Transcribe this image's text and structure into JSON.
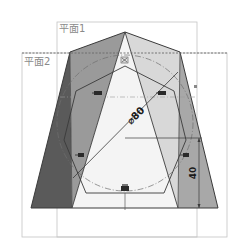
{
  "planes": [
    {
      "label": "平面1",
      "frame": {
        "x": 57,
        "y": 22,
        "w": 140,
        "h": 215
      }
    },
    {
      "label": "平面2",
      "frame": {
        "x": 22,
        "y": 53,
        "w": 205,
        "h": 184
      }
    }
  ],
  "dimensions": {
    "diameter": {
      "text": "⌀80",
      "value": 80
    },
    "height": {
      "text": "40",
      "value": 40
    }
  },
  "colors": {
    "dark_face": "#5a5a5a",
    "mid_face": "#9a9a9a",
    "light_face": "#d8d8d8",
    "right_face": "#a8a8a8",
    "center_face": "#f4f4f4",
    "frame_line": "#bdbdbd",
    "edge_line": "#3a3a3a",
    "construction": "#707070"
  },
  "icons": [
    {
      "name": "constraint-coincident-icon",
      "x": 123,
      "y": 60
    },
    {
      "name": "constraint-horizontal-icon",
      "x": 96,
      "y": 94
    },
    {
      "name": "constraint-horizontal-icon",
      "x": 160,
      "y": 94
    },
    {
      "name": "constraint-vertical-icon",
      "x": 78,
      "y": 155
    },
    {
      "name": "constraint-vertical-icon",
      "x": 184,
      "y": 155
    },
    {
      "name": "constraint-horizontal-icon",
      "x": 123,
      "y": 189
    }
  ]
}
